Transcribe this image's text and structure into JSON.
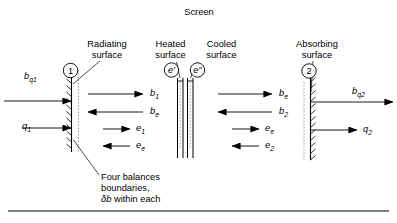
{
  "figure": {
    "background_color": "#ffffff",
    "line_color": "#000000"
  },
  "labels": {
    "screen": "Screen",
    "radiating_surface_line1": "Radiating",
    "radiating_surface_line2": "surface",
    "heated_surface_line1": "Heated",
    "heated_surface_line2": "surface",
    "cooled_surface_line1": "Cooled",
    "cooled_surface_line2": "surface",
    "absorbing_surface_line1": "Absorbing",
    "absorbing_surface_line2": "surface"
  },
  "markers": {
    "surface_1": "1",
    "surface_2": "2",
    "screen_heated": "e′",
    "screen_cooled": "e″"
  },
  "flows": {
    "inlet_radiosity": "b",
    "inlet_radiosity_sub": "q1",
    "inlet_heat": "q",
    "inlet_heat_sub": "1",
    "outlet_radiosity": "b",
    "outlet_radiosity_sub": "q2",
    "outlet_heat": "q",
    "outlet_heat_sub": "2",
    "left_gap": [
      {
        "symbol": "b",
        "sub": "1",
        "direction": "right",
        "length": "long"
      },
      {
        "symbol": "b",
        "sub": "e",
        "direction": "left",
        "length": "long"
      },
      {
        "symbol": "e",
        "sub": "1",
        "direction": "right",
        "length": "short"
      },
      {
        "symbol": "e",
        "sub": "e",
        "direction": "left",
        "length": "short"
      }
    ],
    "right_gap": [
      {
        "symbol": "b",
        "sub": "e",
        "direction": "right",
        "length": "long"
      },
      {
        "symbol": "b",
        "sub": "2",
        "direction": "left",
        "length": "long"
      },
      {
        "symbol": "e",
        "sub": "e",
        "direction": "right",
        "length": "short"
      },
      {
        "symbol": "e",
        "sub": "2",
        "direction": "left",
        "length": "short"
      }
    ]
  },
  "caption": {
    "line1": "Four balances",
    "line2": "boundaries,",
    "line3_prefix": "δb",
    "line3_suffix": " within each"
  }
}
